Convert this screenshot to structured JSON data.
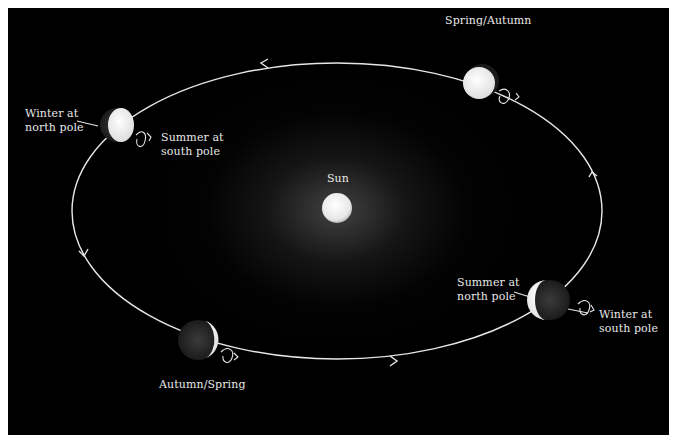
{
  "diagram": {
    "sun": {
      "label": "Sun"
    },
    "positions": [
      {
        "id": "top-left",
        "label_left": "Winter at\nnorth pole",
        "label_right": "Summer at\nsouth pole"
      },
      {
        "id": "top-right",
        "label": "Spring/Autumn"
      },
      {
        "id": "bottom-right",
        "label_left": "Summer at\nnorth pole",
        "label_right": "Winter at\nsouth pole"
      },
      {
        "id": "bottom-left",
        "label": "Autumn/Spring"
      }
    ],
    "orbit": {
      "direction": "counter-clockwise",
      "arrows": 4
    },
    "colors": {
      "background": "#000000",
      "orbit": "#e6e6e6",
      "sun": "#f2f2f2",
      "text": "#e8e8e8",
      "margin": "#ffffff"
    }
  }
}
